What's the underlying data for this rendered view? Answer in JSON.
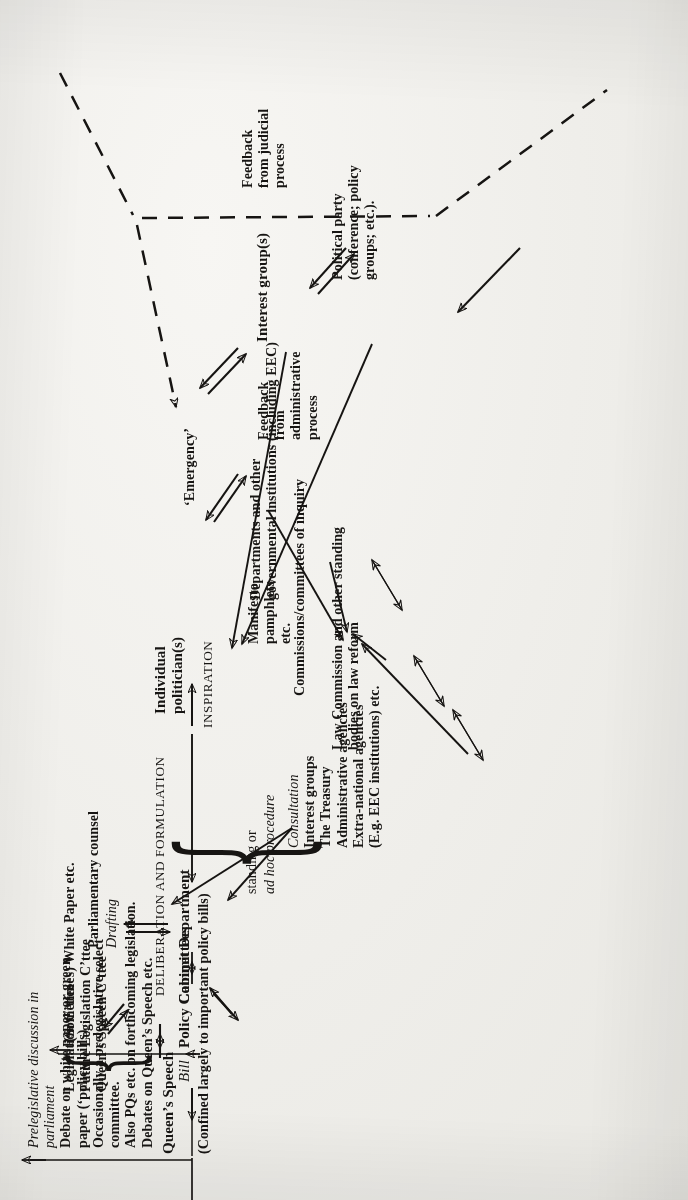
{
  "diagram": {
    "orientation": "rotated-90-ccw",
    "stage_labels": {
      "inspiration": "INSPIRATION",
      "deliberation": "DELIBERATION AND FORMULATION"
    },
    "nodes": {
      "feedback_admin": "Feedback\nfrom\nadministrative\nprocess",
      "feedback_judicial": "Feedback\nfrom judicial\nprocess",
      "emergency": "‘Emergency’",
      "departments": "Departments and other\ngovernmental institutions (including EEC)",
      "commissions": "Commissions/committees of inquiry",
      "law_commission": "Law Commission and other standing\nbodies on law reform",
      "individual_politician": "Individual\npolitician(s)",
      "interest_groups": "Interest group(s)",
      "political_party": "Political party\n(conference; policy\ngroups; etc.).",
      "manifesto": "Manifesto\npamphlets\netc.",
      "department": "Department",
      "cabinet": "Cabinet",
      "policy_committees": "Policy Committees",
      "drafting": "Drafting",
      "parliamentary_counsel": "Parliamentary counsel",
      "white_paper": "(Sometimes) White Paper etc.",
      "bill": "Bill",
      "queens_speech": "Queen’s Speech",
      "queens_speech_note": "(Confined largely to important policy bills)",
      "standing_adhoc_1": "standing or",
      "standing_adhoc_2": "ad hoc procedure"
    },
    "committee_group": {
      "items": [
        "Legislation C’ttee",
        "Future Legislation C’ttee",
        "Queen’s Speech C’ttee"
      ]
    },
    "consultation_group": {
      "heading": "Consultation",
      "items": [
        "Interest groups",
        "The Treasury",
        "Administrative agencies",
        "Extra-national agencies",
        "(E.g. EEC institutions) etc."
      ]
    },
    "prelegislative_group": {
      "heading_line1": "Prelegislative discussion in",
      "heading_line2": "parliament",
      "items": [
        "Debate on white paper or green",
        "paper (‘policy bills)",
        "Occasionally a prelegislative select",
        "committee.",
        "Also PQs etc. on forthcoming legislation.",
        "Debates on Queen’s Speech etc."
      ]
    },
    "colors": {
      "ink": "#171513",
      "paper": "#f2f1ee"
    }
  }
}
